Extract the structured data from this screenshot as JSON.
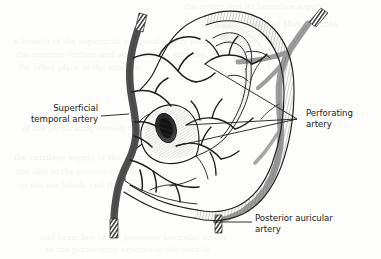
{
  "figure": {
    "kind": "anatomical-illustration",
    "background_color": "#fdfdfc",
    "ink_color": "#1b1b1b",
    "leader_line_color": "#1b1b1b",
    "label_text_color": "#1b1b1b"
  },
  "labels": {
    "superficial_temporal": {
      "line1": "Superficial",
      "line2": "temporal artery",
      "align": "right",
      "text_x": 98,
      "line1_y": 111,
      "line2_y": 122
    },
    "perforating": {
      "line1": "Perforating",
      "line2": "artery",
      "align": "left",
      "text_x": 306,
      "line1_y": 116,
      "line2_y": 127
    },
    "posterior_auricular": {
      "line1": "Posterior auricular",
      "line2": "artery",
      "align": "left",
      "text_x": 255,
      "line1_y": 221,
      "line2_y": 232
    }
  },
  "vessels": [
    {
      "name": "superficial-temporal-artery",
      "tone": "#5b5b5b",
      "description": "Thick vertical trunk crossing anterior to the ear with hatched cut ends top and bottom"
    },
    {
      "name": "posterior-auricular-artery",
      "tone": "#9a9a9a",
      "description": "Lighter gray vessel ascending behind the helix, branching over the cranial surface"
    },
    {
      "name": "perforating-artery",
      "tone": "#1b1b1b",
      "description": "Fine branches perforating the auricular cartilage in scapha, concha and antihelix"
    }
  ],
  "leaders": {
    "superficial_temporal": {
      "x1": 101,
      "y1": 116,
      "x2": 129,
      "y2": 114
    },
    "perforating": [
      {
        "x1": 297,
        "y1": 119,
        "x2": 205,
        "y2": 64
      },
      {
        "x1": 297,
        "y1": 119,
        "x2": 186,
        "y2": 125
      },
      {
        "x1": 297,
        "y1": 119,
        "x2": 176,
        "y2": 146
      }
    ],
    "posterior_auricular": {
      "x1": 252,
      "y1": 222,
      "x2": 213,
      "y2": 222
    }
  },
  "bleed_through": {
    "note": "faint reverse-page text visible through scanned paper",
    "lines": [
      {
        "text": "the artery and its branches supply",
        "x": 184,
        "y": 9,
        "size": 8
      },
      {
        "text": "The cartilage of the auricle",
        "x": 200,
        "y": 27,
        "size": 10
      },
      {
        "text": "a branch of the superficial temporal artery passes",
        "x": 14,
        "y": 44,
        "size": 8
      },
      {
        "text": "the anterior surface and anastomoses with the",
        "x": 16,
        "y": 57,
        "size": 8
      },
      {
        "text": "the other place of the arteries",
        "x": 18,
        "y": 70,
        "size": 8
      },
      {
        "text": "of the perforating vessels in the",
        "x": 22,
        "y": 131,
        "size": 8
      },
      {
        "text": "the cartilage supply of the auricle is",
        "x": 14,
        "y": 160,
        "size": 8
      },
      {
        "text": "the skin of the posterior surface",
        "x": 16,
        "y": 174,
        "size": 8
      },
      {
        "text": "of the ear lobule and the",
        "x": 20,
        "y": 188,
        "size": 8
      },
      {
        "text": "and branches of the posterior auricular artery",
        "x": 40,
        "y": 240,
        "size": 8
      },
      {
        "text": "to the perforating arteries of the auricle",
        "x": 46,
        "y": 252,
        "size": 8
      }
    ]
  }
}
